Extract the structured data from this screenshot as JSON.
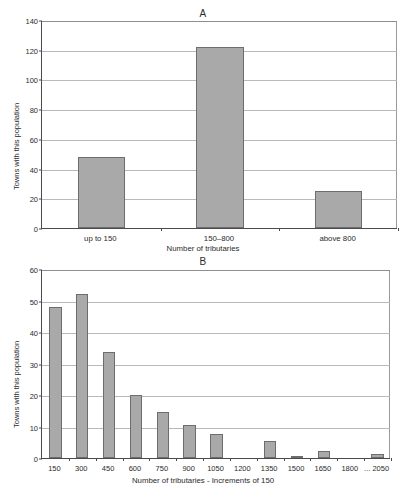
{
  "chart_data": [
    {
      "type": "bar",
      "title": "A",
      "categories": [
        "up to 150",
        "150–800",
        "above 800"
      ],
      "values": [
        48,
        122,
        25
      ],
      "xlabel": "Number of tributaries",
      "ylabel": "Towns with this population",
      "ylim": [
        0,
        140
      ],
      "yticks": [
        0,
        20,
        40,
        60,
        80,
        100,
        120,
        140
      ],
      "grid": true,
      "legend": "none",
      "bar_color": "#a9a9a9",
      "bar_edge_color": "#6d6d6d"
    },
    {
      "type": "bar",
      "title": "B",
      "categories": [
        "150",
        "300",
        "450",
        "600",
        "750",
        "900",
        "1050",
        "1200",
        "1350",
        "1500",
        "1650",
        "1800",
        "... 2050"
      ],
      "values": [
        48,
        52,
        33.5,
        20,
        14.5,
        10.5,
        7.5,
        0,
        5.5,
        0.5,
        2.2,
        0,
        1.3
      ],
      "xlabel": "Number of tributaries - Increments of 150",
      "ylabel": "Towns with this population",
      "ylim": [
        0,
        60
      ],
      "yticks": [
        0,
        10,
        20,
        30,
        40,
        50,
        60
      ],
      "grid": true,
      "legend": "none",
      "bar_color": "#a9a9a9",
      "bar_edge_color": "#6d6d6d"
    }
  ]
}
